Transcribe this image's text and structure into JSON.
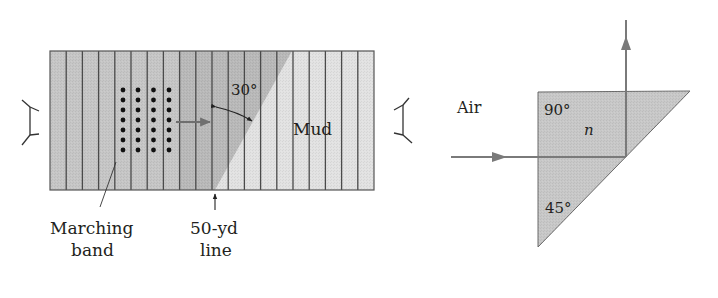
{
  "figure_left": {
    "title": "Marching band analogy",
    "labels": {
      "angle": "30°",
      "region": "Mud",
      "band": [
        "Marching",
        "band"
      ],
      "midline": [
        "50-yd",
        "line"
      ]
    },
    "field": {
      "x": 50,
      "y": 51,
      "width": 324,
      "height": 139,
      "stripe_count": 20
    },
    "band_dots": {
      "columns": 4,
      "rows": 7
    },
    "colors": {
      "grass": "#c4c4c4",
      "grass_dark": "#b4b4b4",
      "mud": "#e0e0e0",
      "stripe": "#4a4a4a",
      "dot": "#111111",
      "arrow": "#6f6f6f"
    }
  },
  "figure_right": {
    "title": "Right-angle prism total internal reflection",
    "labels": {
      "medium_outside": "Air",
      "right_angle": "90°",
      "index": "n",
      "acute_angle": "45°"
    },
    "colors": {
      "prism": "#c6c6c6",
      "ray": "#7a7a7a",
      "edge": "#6a6a6a"
    }
  }
}
